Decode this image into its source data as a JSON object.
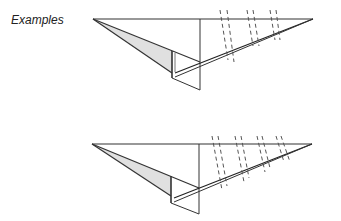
{
  "heading": "Examples",
  "figures": [
    {
      "name": "example-1",
      "fold_lines": 3
    },
    {
      "name": "example-2",
      "fold_lines": 4
    }
  ],
  "colors": {
    "stroke": "#333333",
    "shade": "#e0e0e0",
    "background": "#ffffff"
  }
}
